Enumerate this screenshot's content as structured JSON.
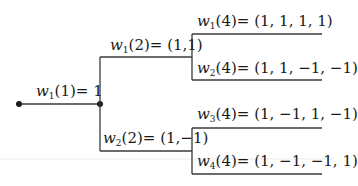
{
  "diagram": {
    "type": "binary-tree",
    "line_color": "#3a3a3a",
    "nodes": {
      "root": {
        "label_var": "w",
        "label_sub": "1",
        "label_arg": "(1)",
        "label_val": "= 1"
      },
      "level2": [
        {
          "label_var": "w",
          "label_sub": "1",
          "label_arg": "(2)",
          "label_val": "= (1,1)"
        },
        {
          "label_var": "w",
          "label_sub": "2",
          "label_arg": "(2)",
          "label_val": "= (1,−1)"
        }
      ],
      "level4": [
        {
          "label_var": "w",
          "label_sub": "1",
          "label_arg": "(4)",
          "label_val": "= (1, 1, 1, 1)"
        },
        {
          "label_var": "w",
          "label_sub": "2",
          "label_arg": "(4)",
          "label_val": "= (1, 1, −1, −1)"
        },
        {
          "label_var": "w",
          "label_sub": "3",
          "label_arg": "(4)",
          "label_val": "= (1, −1, 1, −1)"
        },
        {
          "label_var": "w",
          "label_sub": "4",
          "label_arg": "(4)",
          "label_val": "= (1, −1, −1, 1)"
        }
      ]
    }
  }
}
